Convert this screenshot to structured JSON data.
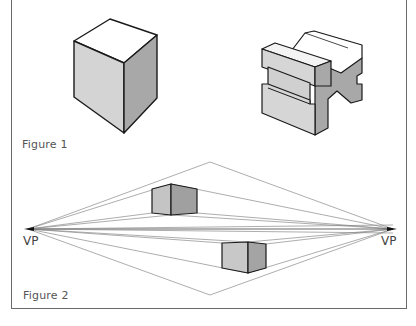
{
  "figures": [
    {
      "caption": "Figure 1",
      "objects": [
        {
          "name": "cube",
          "description": "isometric rectangular block"
        },
        {
          "name": "v-block",
          "description": "V-block with side slots"
        }
      ]
    },
    {
      "caption": "Figure 2",
      "objects": [
        {
          "name": "upper-box",
          "description": "box above horizon line"
        },
        {
          "name": "lower-box",
          "description": "box below horizon line"
        }
      ],
      "vanishing_points": [
        {
          "label": "VP",
          "x": 28,
          "y": 229
        },
        {
          "label": "VP",
          "x": 393,
          "y": 229
        }
      ]
    }
  ],
  "colors": {
    "line": "#1a1a1a",
    "guide": "#8a8a8a",
    "top_face": "#ffffff",
    "light_face": "#d6d6d6",
    "dark_face": "#a9a9a9"
  }
}
